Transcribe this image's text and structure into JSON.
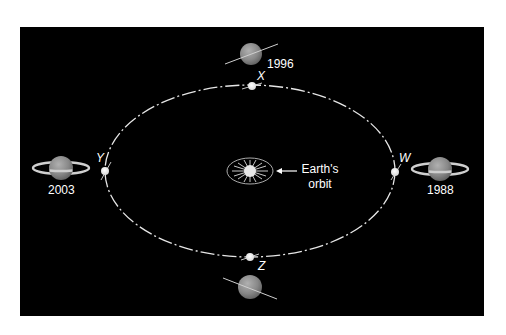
{
  "diagram": {
    "background": "#000000",
    "frame_color": "#000000",
    "orbit": {
      "cx": 250,
      "cy": 171,
      "rx": 145,
      "ry": 86,
      "color": "#e8e8e8"
    },
    "earth_orbit_label": {
      "line1": "Earth's",
      "line2": "orbit"
    },
    "positions": [
      {
        "letter": "W",
        "year": "1988",
        "ring_view": "open"
      },
      {
        "letter": "X",
        "year": "1996",
        "ring_view": "edge-on"
      },
      {
        "letter": "Y",
        "year": "2003",
        "ring_view": "open"
      },
      {
        "letter": "Z",
        "year": "",
        "ring_view": "edge-on"
      }
    ],
    "icons": [
      "sun-icon",
      "saturn-icon",
      "arrow-left-icon"
    ],
    "planet_color": "#8a8a8a",
    "ring_color": "#c8c8c8"
  }
}
